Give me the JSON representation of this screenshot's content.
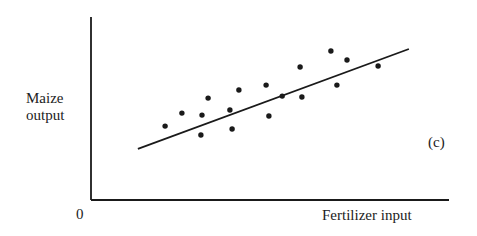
{
  "chart_data": {
    "type": "scatter",
    "title": "",
    "panel_label": "(c)",
    "xlabel": "Fertilizer input",
    "ylabel": "Maize output",
    "ylabel_lines": [
      "Maize",
      "output"
    ],
    "origin_label": "0",
    "xlim": [
      0,
      100
    ],
    "ylim": [
      0,
      100
    ],
    "grid": false,
    "legend": null,
    "axis_ticks": "none (unlabeled axes; values are normalized positions 0-100)",
    "series": [
      {
        "name": "observations",
        "kind": "points",
        "points": [
          {
            "x": 20.7,
            "y": 40.4
          },
          {
            "x": 25.4,
            "y": 47.5
          },
          {
            "x": 30.7,
            "y": 35.5
          },
          {
            "x": 31.0,
            "y": 46.4
          },
          {
            "x": 32.7,
            "y": 55.7
          },
          {
            "x": 38.8,
            "y": 49.2
          },
          {
            "x": 39.4,
            "y": 38.8
          },
          {
            "x": 41.3,
            "y": 60.1
          },
          {
            "x": 48.9,
            "y": 62.8
          },
          {
            "x": 49.7,
            "y": 45.9
          },
          {
            "x": 53.4,
            "y": 56.8
          },
          {
            "x": 58.4,
            "y": 72.7
          },
          {
            "x": 58.9,
            "y": 56.3
          },
          {
            "x": 67.0,
            "y": 81.4
          },
          {
            "x": 68.7,
            "y": 62.8
          },
          {
            "x": 71.5,
            "y": 76.5
          },
          {
            "x": 80.2,
            "y": 73.2
          }
        ]
      },
      {
        "name": "fitted line",
        "kind": "line",
        "points": [
          {
            "x": 13.1,
            "y": 27.9
          },
          {
            "x": 88.8,
            "y": 82.5
          }
        ]
      }
    ],
    "annotations": [
      "(c)"
    ]
  },
  "style": {
    "ink": "#1a1a1a",
    "background": "#ffffff"
  }
}
